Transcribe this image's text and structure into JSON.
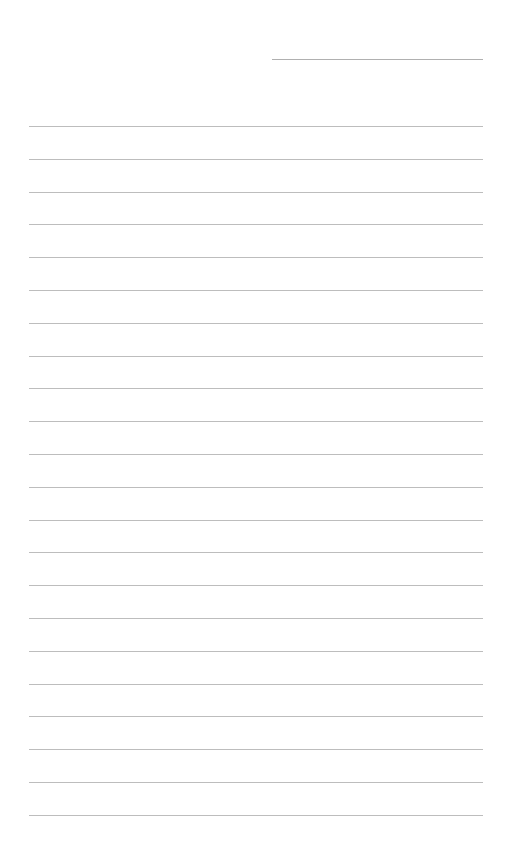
{
  "page": {
    "type": "lined-paper",
    "background": "#ffffff",
    "line_color": "#bdbdbd",
    "date_line": {
      "x": 272,
      "y": 59,
      "width": 211
    },
    "rules": {
      "count": 22,
      "x": 29,
      "width": 454,
      "first_y": 126,
      "spacing": 32.8
    }
  }
}
